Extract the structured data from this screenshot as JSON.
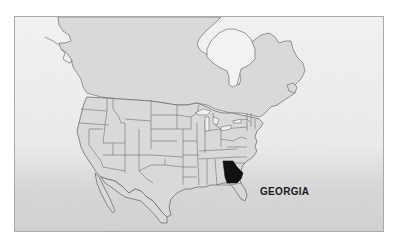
{
  "map": {
    "title": "North America — U.S. states with Georgia highlighted",
    "highlighted_state": "Georgia",
    "label": "GEORGIA",
    "colors": {
      "land": "#d9d9d9",
      "border": "#6e6e6e",
      "highlight": "#111111",
      "water_light": "#f3f3f3",
      "water_dark": "#cfcfcf",
      "frame": "#a9a9a9"
    }
  }
}
